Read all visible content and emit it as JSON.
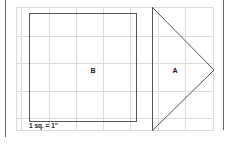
{
  "diagram": {
    "shapes": [
      {
        "id": "B",
        "type": "square",
        "label": "B"
      },
      {
        "id": "A",
        "type": "triangle",
        "label": "A"
      }
    ],
    "scale_label": "1 sq. = 1\"",
    "colors": {
      "outline": "#555555",
      "grid": "#dcdcdc",
      "border": "#666666",
      "text": "#222222",
      "background": "#ffffff"
    }
  }
}
